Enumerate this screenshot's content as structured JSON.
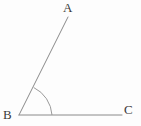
{
  "figure": {
    "kind": "angle-diagram",
    "background_color": "#fdfdfd",
    "stroke_color": "#8a8a8a",
    "label_color": "#3b3b3b",
    "stroke_width": 1,
    "arc_stroke_width": 1,
    "width": 141,
    "height": 126,
    "labels": {
      "a": "A",
      "b": "B",
      "c": "C"
    },
    "points": {
      "A": {
        "x": 68,
        "y": 17
      },
      "B": {
        "x": 19,
        "y": 115
      },
      "C": {
        "x": 122,
        "y": 115
      }
    },
    "segments": [
      {
        "name": "ray-BA",
        "x1": 19,
        "y1": 115,
        "x2": 68,
        "y2": 17
      },
      {
        "name": "ray-BC",
        "x1": 19,
        "y1": 115,
        "x2": 122,
        "y2": 115
      }
    ],
    "angle_arc": {
      "vertex": {
        "x": 19,
        "y": 115
      },
      "radius": 33,
      "start": {
        "x": 52,
        "y": 115
      },
      "end": {
        "x": 33.7,
        "y": 87.5
      },
      "sweep_degrees": 63
    }
  }
}
